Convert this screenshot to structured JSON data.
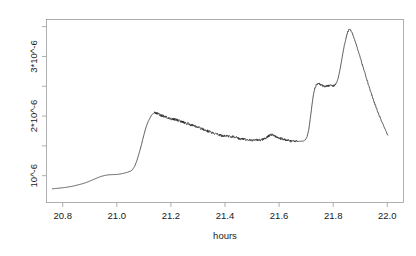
{
  "chart_data": {
    "type": "line",
    "title": "",
    "xlabel": "hours",
    "ylabel": "",
    "xlim": [
      20.74,
      22.06
    ],
    "ylim": [
      5.5e-07,
      3.62e-06
    ],
    "grid": false,
    "legend": null,
    "xticks": [
      20.8,
      21.0,
      21.2,
      21.4,
      21.6,
      21.8,
      22.0
    ],
    "xticklabels": [
      "20.8",
      "21.0",
      "21.2",
      "21.4",
      "21.6",
      "21.8",
      "22.0"
    ],
    "yticks": [
      1e-06,
      1.5e-06,
      2e-06,
      2.5e-06,
      3e-06,
      3.5e-06
    ],
    "ytick_major": [
      1e-06,
      2e-06,
      3e-06
    ],
    "yticklabels": [
      "10^-6",
      "2*10^-6",
      "3*10^-6"
    ],
    "series": [
      {
        "name": "signal",
        "color": "#262626",
        "x": [
          20.762,
          20.775,
          20.79,
          20.805,
          20.82,
          20.835,
          20.85,
          20.865,
          20.88,
          20.895,
          20.91,
          20.925,
          20.94,
          20.952,
          20.962,
          20.972,
          20.985,
          21.0,
          21.012,
          21.025,
          21.04,
          21.05,
          21.058,
          21.066,
          21.074,
          21.082,
          21.09,
          21.097,
          21.104,
          21.11,
          21.116,
          21.122,
          21.128,
          21.134,
          21.14,
          21.148,
          21.156,
          21.164,
          21.172,
          21.18,
          21.188,
          21.196,
          21.204,
          21.212,
          21.22,
          21.228,
          21.236,
          21.244,
          21.252,
          21.26,
          21.268,
          21.276,
          21.284,
          21.292,
          21.3,
          21.31,
          21.32,
          21.33,
          21.34,
          21.35,
          21.36,
          21.37,
          21.38,
          21.39,
          21.4,
          21.41,
          21.42,
          21.43,
          21.44,
          21.45,
          21.46,
          21.47,
          21.48,
          21.49,
          21.5,
          21.51,
          21.52,
          21.53,
          21.54,
          21.55,
          21.556,
          21.562,
          21.57,
          21.578,
          21.586,
          21.594,
          21.602,
          21.61,
          21.618,
          21.626,
          21.634,
          21.642,
          21.65,
          21.658,
          21.666,
          21.674,
          21.682,
          21.69,
          21.697,
          21.704,
          21.71,
          21.716,
          21.722,
          21.727,
          21.732,
          21.737,
          21.742,
          21.747,
          21.752,
          21.758,
          21.764,
          21.77,
          21.776,
          21.782,
          21.788,
          21.794,
          21.8,
          21.806,
          21.812,
          21.818,
          21.824,
          21.83,
          21.836,
          21.842,
          21.848,
          21.854,
          21.86,
          21.868,
          21.876,
          21.884,
          21.892,
          21.9,
          21.908,
          21.916,
          21.924,
          21.932,
          21.94,
          21.948,
          21.956,
          21.964,
          21.972,
          21.98,
          21.988,
          21.996,
          22.002
        ],
        "y": [
          7.8e-07,
          7.85e-07,
          7.92e-07,
          8e-07,
          8.1e-07,
          8.22e-07,
          8.38e-07,
          8.55e-07,
          8.75e-07,
          9e-07,
          9.28e-07,
          9.58e-07,
          9.85e-07,
          1e-06,
          1.01e-06,
          1.015e-06,
          1.018e-06,
          1.02e-06,
          1.028e-06,
          1.04e-06,
          1.058e-06,
          1.075e-06,
          1.1e-06,
          1.155e-06,
          1.25e-06,
          1.37e-06,
          1.5e-06,
          1.63e-06,
          1.75e-06,
          1.84e-06,
          1.91e-06,
          1.96e-06,
          2.015e-06,
          2.04e-06,
          2.055e-06,
          2.045e-06,
          2.03e-06,
          2.012e-06,
          1.998e-06,
          1.985e-06,
          1.975e-06,
          1.962e-06,
          1.952e-06,
          1.945e-06,
          1.934e-06,
          1.925e-06,
          1.912e-06,
          1.9e-06,
          1.888e-06,
          1.875e-06,
          1.862e-06,
          1.848e-06,
          1.836e-06,
          1.822e-06,
          1.81e-06,
          1.792e-06,
          1.776e-06,
          1.758e-06,
          1.742e-06,
          1.726e-06,
          1.71e-06,
          1.695e-06,
          1.682e-06,
          1.672e-06,
          1.668e-06,
          1.666e-06,
          1.66e-06,
          1.65e-06,
          1.638e-06,
          1.628e-06,
          1.618e-06,
          1.612e-06,
          1.608e-06,
          1.602e-06,
          1.598e-06,
          1.596e-06,
          1.598e-06,
          1.602e-06,
          1.612e-06,
          1.628e-06,
          1.648e-06,
          1.672e-06,
          1.69e-06,
          1.68e-06,
          1.66e-06,
          1.642e-06,
          1.628e-06,
          1.618e-06,
          1.608e-06,
          1.598e-06,
          1.59e-06,
          1.582e-06,
          1.578e-06,
          1.576e-06,
          1.575e-06,
          1.576e-06,
          1.578e-06,
          1.582e-06,
          1.6e-06,
          1.66e-06,
          1.78e-06,
          1.98e-06,
          2.2e-06,
          2.36e-06,
          2.46e-06,
          2.52e-06,
          2.545e-06,
          2.548e-06,
          2.535e-06,
          2.52e-06,
          2.508e-06,
          2.5e-06,
          2.502e-06,
          2.51e-06,
          2.515e-06,
          2.51e-06,
          2.505e-06,
          2.515e-06,
          2.55e-06,
          2.63e-06,
          2.75e-06,
          2.9e-06,
          3.06e-06,
          3.2e-06,
          3.32e-06,
          3.41e-06,
          3.46e-06,
          3.42e-06,
          3.33e-06,
          3.22e-06,
          3.1e-06,
          2.98e-06,
          2.86e-06,
          2.74e-06,
          2.62e-06,
          2.5e-06,
          2.39e-06,
          2.28e-06,
          2.18e-06,
          2.08e-06,
          1.99e-06,
          1.9e-06,
          1.82e-06,
          1.74e-06,
          1.68e-06
        ],
        "noise_regions": [
          {
            "x_start": 21.14,
            "x_end": 21.67,
            "amplitude": 2.2e-08
          },
          {
            "x_start": 21.73,
            "x_end": 21.81,
            "amplitude": 1.8e-08
          },
          {
            "x_start": 21.84,
            "x_end": 22.0,
            "amplitude": 1.2e-08
          }
        ]
      }
    ]
  },
  "figure": {
    "background_color": "#ffffff",
    "frame_color": "#8c8c8c",
    "text_color": "#1a1a1a",
    "line_color": "#262626"
  }
}
